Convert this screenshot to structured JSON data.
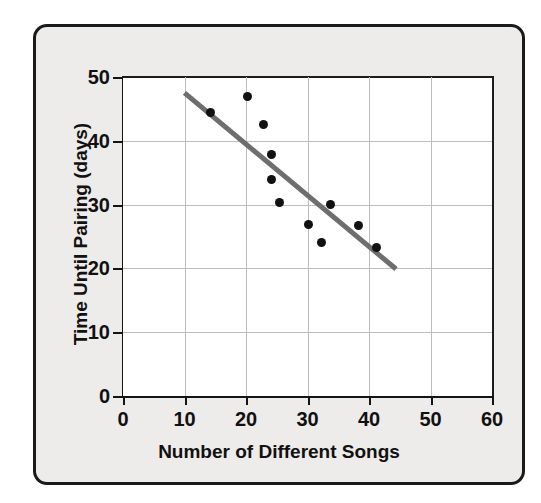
{
  "chart_data": {
    "type": "scatter",
    "title": "",
    "xlabel": "Number of Different Songs",
    "ylabel": "Time Until Pairing (days)",
    "xlim": [
      0,
      60
    ],
    "ylim": [
      0,
      50
    ],
    "xticks": [
      0,
      10,
      20,
      30,
      40,
      50,
      60
    ],
    "yticks": [
      0,
      10,
      20,
      30,
      40,
      50
    ],
    "xtick_labels": [
      "0",
      "10",
      "20",
      "30",
      "40",
      "50",
      "60"
    ],
    "ytick_labels": [
      "0",
      "10",
      "20",
      "30",
      "40",
      "50"
    ],
    "grid": true,
    "legend": null,
    "points": [
      {
        "x": 14.3,
        "y": 44.5
      },
      {
        "x": 20.3,
        "y": 46.9
      },
      {
        "x": 22.9,
        "y": 42.5
      },
      {
        "x": 24.1,
        "y": 37.9
      },
      {
        "x": 24.1,
        "y": 33.9
      },
      {
        "x": 25.5,
        "y": 30.3
      },
      {
        "x": 30.2,
        "y": 26.9
      },
      {
        "x": 32.3,
        "y": 24.0
      },
      {
        "x": 33.8,
        "y": 30.0
      },
      {
        "x": 38.3,
        "y": 26.7
      },
      {
        "x": 41.2,
        "y": 23.3
      }
    ],
    "trend_line": {
      "x_start": 10,
      "y_start": 47.5,
      "x_end": 44.4,
      "y_end": 19.9,
      "color": "#6e6e6e",
      "width": 5
    },
    "marker_color": "#111111",
    "marker_size": 9,
    "plot_bg": "#ffffff",
    "card_bg": "#eeecea",
    "grid_color": "#bdbdbd",
    "axis_color": "#141414"
  }
}
